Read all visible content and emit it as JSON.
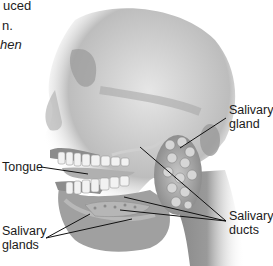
{
  "caption": {
    "lines": [
      "uced",
      "n.",
      "hen"
    ]
  },
  "figure": {
    "labels": {
      "salivary_gland": [
        "Salivary",
        "gland"
      ],
      "tongue": "Tongue",
      "salivary_ducts": [
        "Salivary",
        "ducts"
      ],
      "salivary_glands": [
        "Salivary",
        "glands"
      ]
    }
  }
}
